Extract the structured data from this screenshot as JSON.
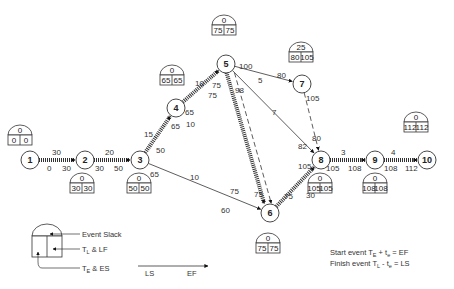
{
  "diagram": {
    "type": "PERT/CPM network",
    "nodes": [
      {
        "id": "1",
        "x": 30,
        "y": 160,
        "slack": "0",
        "tl": "0",
        "te": "0",
        "box": [
          8,
          125
        ]
      },
      {
        "id": "2",
        "x": 85,
        "y": 160,
        "slack": "0",
        "tl": "30",
        "te": "30",
        "box": [
          70,
          173
        ]
      },
      {
        "id": "3",
        "x": 140,
        "y": 160,
        "slack": "0",
        "tl": "50",
        "te": "50",
        "box": [
          127,
          173
        ]
      },
      {
        "id": "4",
        "x": 176,
        "y": 108,
        "slack": "0",
        "tl": "65",
        "te": "65",
        "box": [
          160,
          65
        ]
      },
      {
        "id": "5",
        "x": 226,
        "y": 64,
        "slack": "0",
        "tl": "75",
        "te": "75",
        "box": [
          212,
          15
        ]
      },
      {
        "id": "6",
        "x": 270,
        "y": 213,
        "slack": "0",
        "tl": "75",
        "te": "75",
        "box": [
          256,
          233
        ]
      },
      {
        "id": "7",
        "x": 302,
        "y": 84,
        "slack": "25",
        "tl": "105",
        "te": "80",
        "box": [
          289,
          42
        ]
      },
      {
        "id": "8",
        "x": 321,
        "y": 160,
        "slack": "0",
        "tl": "105",
        "te": "105",
        "box": [
          308,
          173
        ]
      },
      {
        "id": "9",
        "x": 375,
        "y": 160,
        "slack": "0",
        "tl": "108",
        "te": "108",
        "box": [
          363,
          173
        ]
      },
      {
        "id": "10",
        "x": 427,
        "y": 160,
        "slack": "0",
        "tl": "112",
        "te": "112",
        "box": [
          404,
          112
        ]
      }
    ],
    "labels": [
      {
        "t": "30",
        "x": 52,
        "y": 155
      },
      {
        "t": "0",
        "x": 47,
        "y": 171
      },
      {
        "t": "30",
        "x": 62,
        "y": 171
      },
      {
        "t": "20",
        "x": 105,
        "y": 155
      },
      {
        "t": "30",
        "x": 95,
        "y": 171
      },
      {
        "t": "50",
        "x": 114,
        "y": 171
      },
      {
        "t": "15",
        "x": 144,
        "y": 137
      },
      {
        "t": "50",
        "x": 156,
        "y": 153
      },
      {
        "t": "65",
        "x": 150,
        "y": 177
      },
      {
        "t": "10",
        "x": 186,
        "y": 127
      },
      {
        "t": "65",
        "x": 185,
        "y": 115
      },
      {
        "t": "65",
        "x": 171,
        "y": 129
      },
      {
        "t": "10",
        "x": 195,
        "y": 86
      },
      {
        "t": "75",
        "x": 212,
        "y": 88
      },
      {
        "t": "75",
        "x": 208,
        "y": 98
      },
      {
        "t": "98",
        "x": 235,
        "y": 93
      },
      {
        "t": "100",
        "x": 239,
        "y": 69
      },
      {
        "t": "80",
        "x": 277,
        "y": 78
      },
      {
        "t": "5",
        "x": 258,
        "y": 83
      },
      {
        "t": "7",
        "x": 272,
        "y": 115
      },
      {
        "t": "105",
        "x": 306,
        "y": 101
      },
      {
        "t": "80",
        "x": 312,
        "y": 141
      },
      {
        "t": "82",
        "x": 298,
        "y": 149
      },
      {
        "t": "105",
        "x": 298,
        "y": 169
      },
      {
        "t": "10",
        "x": 190,
        "y": 180
      },
      {
        "t": "60",
        "x": 221,
        "y": 213
      },
      {
        "t": "75",
        "x": 230,
        "y": 194
      },
      {
        "t": "75",
        "x": 254,
        "y": 197
      },
      {
        "t": "75",
        "x": 284,
        "y": 199
      },
      {
        "t": "30",
        "x": 306,
        "y": 198
      },
      {
        "t": "3",
        "x": 341,
        "y": 155
      },
      {
        "t": "105",
        "x": 326,
        "y": 171
      },
      {
        "t": "108",
        "x": 348,
        "y": 171
      },
      {
        "t": "4",
        "x": 391,
        "y": 155
      },
      {
        "t": "108",
        "x": 384,
        "y": 171
      },
      {
        "t": "112",
        "x": 405,
        "y": 171
      }
    ]
  },
  "legend": {
    "event_slack": "Event Slack",
    "tl_lf": "T",
    "tl_lf_sub": "L",
    "tl_lf_rest": " & LF",
    "te_es": "T",
    "te_es_sub": "E",
    "te_es_rest": " & ES",
    "ls": "LS",
    "ef": "EF",
    "formula1": "Start event T",
    "formula1_sub": "E",
    "formula1_rest": " + t",
    "formula1_sub2": "e",
    "formula1_end": " = EF",
    "formula2": "Finish event T",
    "formula2_sub": "L",
    "formula2_rest": " - t",
    "formula2_sub2": "e",
    "formula2_end": " = LS"
  }
}
